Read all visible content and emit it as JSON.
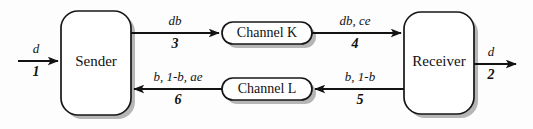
{
  "diagram": {
    "background_color": "#fdfdfd",
    "line_color": "#131313",
    "shadow_color": "#9a9a9a",
    "nodes": {
      "sender": {
        "label": "Sender"
      },
      "receiver": {
        "label": "Receiver"
      },
      "channel_k": {
        "label": "Channel K"
      },
      "channel_l": {
        "label": "Channel L"
      }
    },
    "edges": {
      "input": {
        "symbol": "d",
        "number": "1"
      },
      "sender_to_k": {
        "symbol": "db",
        "number": "3"
      },
      "k_to_receiver": {
        "symbol": "db, ce",
        "number": "4"
      },
      "receiver_to_l": {
        "symbol": "b, 1-b",
        "number": "5"
      },
      "l_to_sender": {
        "symbol": "b, 1-b, ae",
        "number": "6"
      },
      "output": {
        "symbol": "d",
        "number": "2"
      }
    }
  }
}
